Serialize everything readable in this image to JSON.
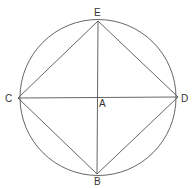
{
  "diagram": {
    "type": "geometry",
    "stroke_color": "#555555",
    "label_color": "#333333",
    "circle": {
      "center": "A",
      "cx": 98,
      "cy": 97.5,
      "r": 78
    },
    "points": {
      "A": {
        "label": "A",
        "x": 98,
        "y": 97.5
      },
      "B": {
        "label": "B",
        "x": 97,
        "y": 174
      },
      "C": {
        "label": "C",
        "x": 18,
        "y": 98
      },
      "D": {
        "label": "D",
        "x": 178,
        "y": 97
      },
      "E": {
        "label": "E",
        "x": 98,
        "y": 21
      }
    },
    "segments": [
      [
        "E",
        "D"
      ],
      [
        "D",
        "B"
      ],
      [
        "B",
        "C"
      ],
      [
        "C",
        "E"
      ],
      [
        "C",
        "D"
      ],
      [
        "E",
        "B"
      ]
    ]
  }
}
